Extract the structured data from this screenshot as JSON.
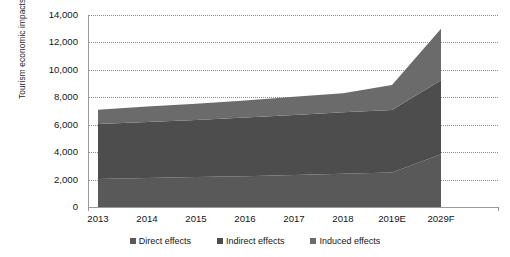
{
  "chart_data": {
    "type": "area",
    "stacked": true,
    "title": "",
    "xlabel": "",
    "ylabel": "Tourism economic impacts (Billion, USD)",
    "categories": [
      "2013",
      "2014",
      "2015",
      "2016",
      "2017",
      "2018",
      "2019E",
      "2029F"
    ],
    "ylim": [
      0,
      14000
    ],
    "yticks": [
      "0",
      "2,000",
      "4,000",
      "6,000",
      "8,000",
      "10,000",
      "12,000",
      "14,000"
    ],
    "ytick_values": [
      0,
      2000,
      4000,
      6000,
      8000,
      10000,
      12000,
      14000
    ],
    "grid": true,
    "legend_position": "bottom",
    "series": [
      {
        "name": "Direct effects",
        "color": "#595959",
        "values": [
          2050,
          2120,
          2180,
          2250,
          2330,
          2420,
          2520,
          3850
        ]
      },
      {
        "name": "Indirect effects",
        "color": "#4d4d4d",
        "values": [
          4000,
          4080,
          4170,
          4270,
          4380,
          4480,
          4560,
          5400
        ]
      },
      {
        "name": "Induced effects",
        "color": "#6b6b6b",
        "values": [
          1050,
          1120,
          1180,
          1250,
          1330,
          1400,
          1810,
          3750
        ]
      }
    ],
    "totals": [
      7100,
      7320,
      7530,
      7770,
      8040,
      8300,
      8890,
      13000
    ]
  },
  "legend": {
    "items": [
      {
        "label": "Direct effects",
        "color": "#595959"
      },
      {
        "label": "Indirect effects",
        "color": "#4d4d4d"
      },
      {
        "label": "Induced effects",
        "color": "#6b6b6b"
      }
    ]
  }
}
